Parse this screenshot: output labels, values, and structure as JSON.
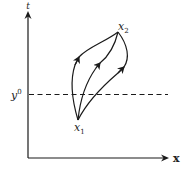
{
  "diagram": {
    "axes": {
      "vertical_label": "t",
      "horizontal_label": "x"
    },
    "threshold": {
      "label_base": "y",
      "label_sup": "0",
      "style": "dashed"
    },
    "points": {
      "start": {
        "label_base": "x",
        "label_sub": "1"
      },
      "end": {
        "label_base": "x",
        "label_sub": "2"
      }
    },
    "paths": [
      {
        "name": "left-path",
        "direction": "x1-to-x2"
      },
      {
        "name": "middle-path",
        "direction": "x1-to-x2"
      },
      {
        "name": "right-path",
        "direction": "x1-to-x2"
      }
    ],
    "colors": {
      "stroke": "#1a1a1a",
      "background": "#ffffff"
    }
  }
}
